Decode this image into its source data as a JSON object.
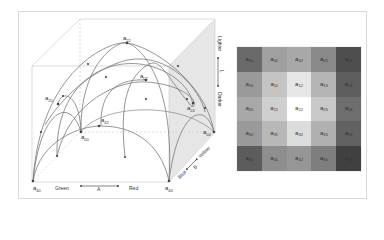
{
  "figure": {
    "dome": {
      "points": [
        {
          "id": "a22",
          "label": "a",
          "sub": "22",
          "x": 127,
          "y": 43,
          "lx": 123,
          "ly": 40
        },
        {
          "id": "a02",
          "label": "a",
          "sub": "02",
          "x": 146,
          "y": 80,
          "lx": 140,
          "ly": 78
        },
        {
          "id": "a20",
          "label": "a",
          "sub": "20",
          "x": 58,
          "y": 104,
          "lx": 45,
          "ly": 100
        },
        {
          "id": "a42",
          "label": "a",
          "sub": "42",
          "x": 99,
          "y": 126,
          "lx": 101,
          "ly": 122
        },
        {
          "id": "a00",
          "label": "a",
          "sub": "00",
          "x": 81,
          "y": 132,
          "lx": 81,
          "ly": 139
        },
        {
          "id": "a24",
          "label": "a",
          "sub": "24",
          "x": 193,
          "y": 103,
          "lx": 187,
          "ly": 110
        },
        {
          "id": "a04",
          "label": "a",
          "sub": "04",
          "x": 214,
          "y": 132,
          "lx": 203,
          "ly": 134
        },
        {
          "id": "a40",
          "label": "a",
          "sub": "40",
          "x": 33,
          "y": 181,
          "lx": 33,
          "ly": 190
        },
        {
          "id": "a44",
          "label": "a",
          "sub": "44",
          "x": 169,
          "y": 181,
          "lx": 165,
          "ly": 190
        }
      ],
      "axes": {
        "a_axis": {
          "left": "Green",
          "center": "A",
          "right": "Red"
        },
        "b_axis": {
          "low": "Blue",
          "center": "B",
          "high": "Yellow"
        },
        "l_axis": {
          "high": "Lighter",
          "center": "L",
          "low": "Darker"
        }
      }
    },
    "grid": {
      "rows": 5,
      "cols": 5,
      "cells": [
        [
          {
            "sub": "00",
            "color": "#6a6a6a"
          },
          {
            "sub": "01",
            "color": "#a0a0a0"
          },
          {
            "sub": "02",
            "color": "#a8a8a8"
          },
          {
            "sub": "03",
            "color": "#8a8a8a"
          },
          {
            "sub": "04",
            "color": "#4e4e4e"
          }
        ],
        [
          {
            "sub": "10",
            "color": "#9a9a9a"
          },
          {
            "sub": "11",
            "color": "#c4c4c4"
          },
          {
            "sub": "12",
            "color": "#e6e6e6"
          },
          {
            "sub": "13",
            "color": "#b4b4b4"
          },
          {
            "sub": "14",
            "color": "#5e5e5e"
          }
        ],
        [
          {
            "sub": "20",
            "color": "#a8a8a8"
          },
          {
            "sub": "21",
            "color": "#cfcfcf"
          },
          {
            "sub": "22",
            "color": "#ffffff"
          },
          {
            "sub": "23",
            "color": "#c8c8c8"
          },
          {
            "sub": "24",
            "color": "#6e6e6e"
          }
        ],
        [
          {
            "sub": "30",
            "color": "#9a9a9a"
          },
          {
            "sub": "31",
            "color": "#b8b8b8"
          },
          {
            "sub": "32",
            "color": "#dcdcdc"
          },
          {
            "sub": "33",
            "color": "#b0b0b0"
          },
          {
            "sub": "34",
            "color": "#626262"
          }
        ],
        [
          {
            "sub": "40",
            "color": "#5c5c5c"
          },
          {
            "sub": "41",
            "color": "#8e8e8e"
          },
          {
            "sub": "42",
            "color": "#969696"
          },
          {
            "sub": "43",
            "color": "#7e7e7e"
          },
          {
            "sub": "44",
            "color": "#404040"
          }
        ]
      ],
      "label_prefix": "a"
    },
    "colors": {
      "frame": "#d9d9d9",
      "box_line": "#c8c8c8",
      "arc": "#7a7a7a",
      "shaded_face": "#e4e4e4",
      "point": "#444444"
    }
  }
}
